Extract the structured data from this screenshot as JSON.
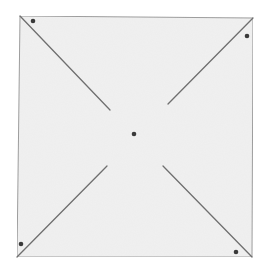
{
  "diagram": {
    "colors": {
      "background": "#ffffff",
      "paper": "#f1f1f1",
      "paper_edge": "#9c9c9c",
      "cut_line": "#6f6f6f",
      "dot": "#3a3a3a"
    },
    "square": {
      "corners": {
        "top_left": [
          20,
          16
        ],
        "top_right": [
          253,
          18
        ],
        "bottom_right": [
          252,
          257
        ],
        "bottom_left": [
          17,
          257
        ]
      }
    },
    "cuts": [
      {
        "name": "top-left",
        "from": [
          20,
          16
        ],
        "to": [
          110,
          110
        ]
      },
      {
        "name": "top-right",
        "from": [
          253,
          18
        ],
        "to": [
          168,
          104
        ]
      },
      {
        "name": "bottom-right",
        "from": [
          252,
          257
        ],
        "to": [
          163,
          166
        ]
      },
      {
        "name": "bottom-left",
        "from": [
          17,
          257
        ],
        "to": [
          107,
          166
        ]
      }
    ],
    "dots": [
      {
        "name": "top-left",
        "cx": 33,
        "cy": 21
      },
      {
        "name": "top-right",
        "cx": 247,
        "cy": 36
      },
      {
        "name": "bottom-right",
        "cx": 236,
        "cy": 252
      },
      {
        "name": "bottom-left",
        "cx": 21,
        "cy": 244
      },
      {
        "name": "center",
        "cx": 134,
        "cy": 134
      }
    ]
  }
}
